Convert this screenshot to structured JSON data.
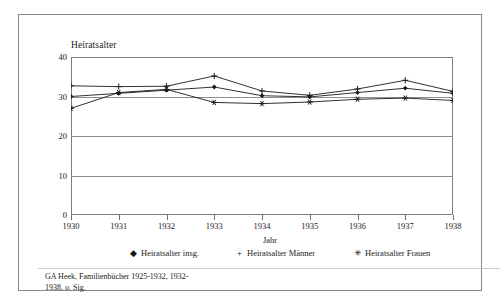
{
  "figure": {
    "source_note_line1": "GA Heek, Familienbücher 1925-1932, 1932-",
    "source_note_line2": "1938, o. Sig."
  },
  "chart_data": {
    "type": "line",
    "title": "Heiratsalter",
    "xlabel": "Jahr",
    "ylabel": "",
    "categories": [
      "1930",
      "1931",
      "1932",
      "1933",
      "1934",
      "1935",
      "1936",
      "1937",
      "1938"
    ],
    "x": [
      1930,
      1931,
      1932,
      1933,
      1934,
      1935,
      1936,
      1937,
      1938
    ],
    "ylim": [
      0,
      40
    ],
    "yticks": [
      "0",
      "10",
      "20",
      "30",
      "40"
    ],
    "ytick_values": [
      0,
      10,
      20,
      30,
      40
    ],
    "grid": true,
    "legend_position": "bottom",
    "series": [
      {
        "name": "Heiratsalter insg.",
        "marker": "diamond",
        "marker_glyph": "◆",
        "color": "#1a1a1a",
        "values": [
          30.0,
          30.8,
          31.6,
          32.4,
          30.2,
          29.9,
          31.0,
          32.1,
          30.8
        ]
      },
      {
        "name": "Heiratsalter Männer",
        "marker": "plus",
        "marker_glyph": "+",
        "color": "#1a1a1a",
        "values": [
          32.7,
          32.5,
          32.6,
          35.2,
          31.4,
          30.3,
          31.9,
          34.1,
          31.3
        ]
      },
      {
        "name": "Heiratsalter Frauen",
        "marker": "star",
        "marker_glyph": "✳",
        "color": "#1a1a1a",
        "values": [
          27.0,
          31.0,
          31.8,
          28.5,
          28.2,
          28.6,
          29.3,
          29.6,
          29.0
        ]
      }
    ]
  }
}
